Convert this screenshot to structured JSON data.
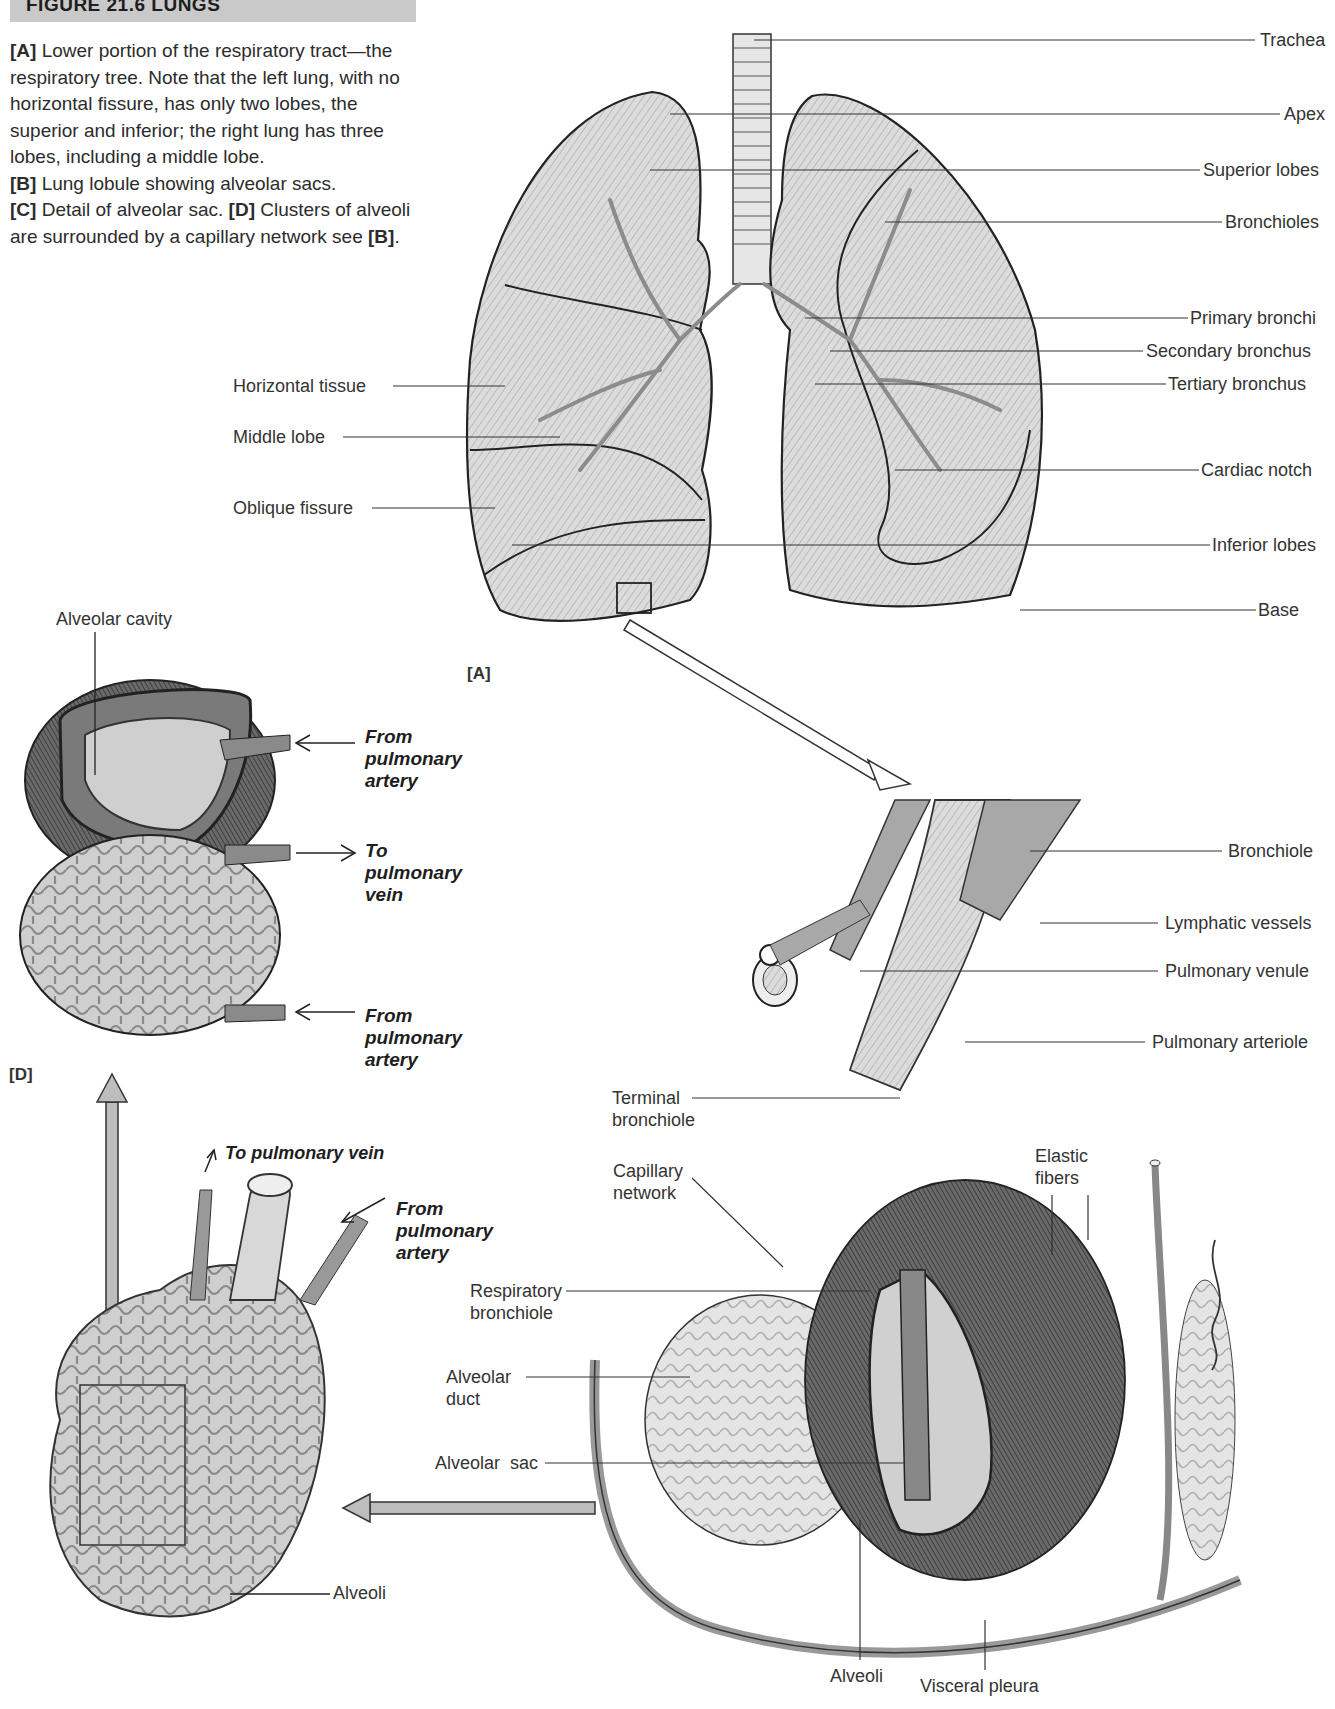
{
  "figure": {
    "header": "FIGURE 21.6 LUNGS",
    "caption": [
      {
        "tag": "[A]",
        "text": " Lower portion of the respiratory tract—the respiratory tree. Note that the left lung, with no horizontal fissure, has only two lobes, the superior and inferior; the right lung has three lobes, including a middle lobe."
      },
      {
        "tag": "[B]",
        "text": " Lung lobule showing alveolar sacs."
      },
      {
        "tag": "[C]",
        "text": " Detail of alveolar sac. "
      },
      {
        "tag": "[D]",
        "text": " Clusters of alveoli are surrounded by a capillary network see "
      },
      {
        "tag": "[B]",
        "text": "."
      }
    ],
    "panel_labels": {
      "a": "[A]",
      "d": "[D]"
    }
  },
  "panel_a": {
    "labels_right": [
      "Trachea",
      "Apex",
      "Superior lobes",
      "Bronchioles",
      "Primary bronchi",
      "Secondary bronchus",
      "Tertiary bronchus",
      "Cardiac notch",
      "Inferior lobes",
      "Base"
    ],
    "labels_left": [
      "Horizontal tissue",
      "Middle lobe",
      "Oblique fissure"
    ]
  },
  "panel_d": {
    "alveolar_cavity": "Alveolar cavity",
    "arrows": [
      {
        "text": "From\npulmonary\nartery",
        "direction": "in"
      },
      {
        "text": "To\npulmonary\nvein",
        "direction": "out"
      },
      {
        "text": "From\npulmonary\nartery",
        "direction": "in"
      }
    ]
  },
  "panel_c": {
    "to_vein": "To pulmonary vein",
    "from_artery": "From\npulmonary\nartery",
    "alveoli": "Alveoli"
  },
  "panel_b": {
    "labels_right": [
      "Bronchiole",
      "Lymphatic vessels",
      "Pulmonary venule",
      "Pulmonary arteriole"
    ],
    "labels_left": [
      "Terminal\nbronchiole",
      "Capillary\nnetwork",
      "Respiratory\nbronchiole",
      "Alveolar\nduct",
      "Alveolar  sac"
    ],
    "elastic_fibers": "Elastic\nfibers",
    "bottom": [
      "Alveoli",
      "Visceral pleura"
    ]
  }
}
